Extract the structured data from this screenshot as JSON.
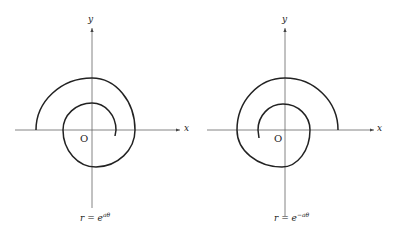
{
  "figures": [
    {
      "id": "left",
      "x_label": "x",
      "y_label": "y",
      "origin_label": "O",
      "equation": {
        "base": "r = e",
        "exponent": "aθ"
      },
      "description": "Logarithmic spiral, radius growing with angle"
    },
    {
      "id": "right",
      "x_label": "x",
      "y_label": "y",
      "origin_label": "O",
      "equation": {
        "base": "r = e",
        "exponent": "−aθ"
      },
      "description": "Logarithmic spiral, mirrored orientation"
    }
  ],
  "colors": {
    "axis": "#555555",
    "curve": "#222222",
    "background": "#ffffff"
  }
}
